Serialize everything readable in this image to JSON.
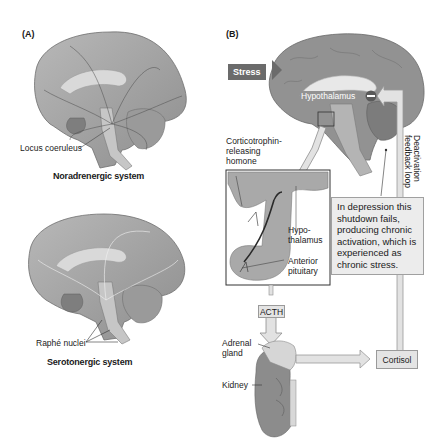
{
  "panel_a": {
    "label": "(A)",
    "top": {
      "structure_label": "Locus coeruleus",
      "caption": "Noradrenergic system"
    },
    "bottom": {
      "structure_label": "Raphé nuclei",
      "caption": "Serotonergic system"
    }
  },
  "panel_b": {
    "label": "(B)",
    "stress_label": "Stress",
    "hypothalamus_label": "Hypothalamus",
    "inhibit_symbol": "−",
    "crh_label_line1": "Corticotrophin-",
    "crh_label_line2": "releasing",
    "crh_label_line3": "homone",
    "inset": {
      "hypothalamus_line1": "Hypo-",
      "hypothalamus_line2": "thalamus",
      "pituitary_line1": "Anterior",
      "pituitary_line2": "pituitary"
    },
    "acth_label": "ACTH",
    "adrenal_line1": "Adrenal",
    "adrenal_line2": "gland",
    "kidney_label": "Kidney",
    "cortisol_label": "Cortisol",
    "feedback_line1": "Deactivation",
    "feedback_line2": "feedback loop",
    "depression_note": "In depression this shutdown fails, producing chronic activation, which is experienced as chronic stress."
  },
  "colors": {
    "brain_dark": "#8a8a8a",
    "brain_mid": "#a9a9a9",
    "brain_light": "#c8c8c8",
    "stress_box": "#6b6b6b",
    "arrow_fill": "#e2e2e2",
    "arrow_stroke": "#9a9a9a",
    "note_bg": "#ececec"
  }
}
